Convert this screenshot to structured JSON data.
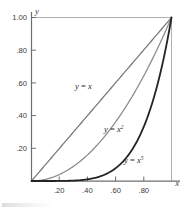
{
  "figure": {
    "background_color": "#ffffff",
    "axis_color": "#6e6e6e",
    "frame_color": "#aeaeae",
    "text_color": "#3a3a3a"
  },
  "chart_data": {
    "type": "line",
    "title": "",
    "subtitle": "",
    "xlabel": "x",
    "ylabel": "y",
    "xlim": [
      0,
      1
    ],
    "ylim": [
      0,
      1
    ],
    "grid": false,
    "legend_position": "inline-annotations",
    "x_tick_labels": [
      ".20",
      ".40",
      ".60",
      ".80"
    ],
    "x_tick_values": [
      0.2,
      0.4,
      0.6,
      0.8
    ],
    "y_tick_labels": [
      ".20",
      ".40",
      ".60",
      ".80",
      "1.00"
    ],
    "y_tick_values": [
      0.2,
      0.4,
      0.6,
      0.8,
      1.0
    ],
    "x": [
      0,
      0.1,
      0.2,
      0.3,
      0.4,
      0.5,
      0.6,
      0.7,
      0.8,
      0.9,
      1.0
    ],
    "series": [
      {
        "name": "y = x",
        "exponent": 1,
        "color": "#777777",
        "line_width": 1.25,
        "values": [
          0,
          0.1,
          0.2,
          0.3,
          0.4,
          0.5,
          0.6,
          0.7,
          0.8,
          0.9,
          1.0
        ],
        "label_text": "y = x",
        "label_base": "y",
        "label_op": " = ",
        "label_var": "x",
        "label_sup": ""
      },
      {
        "name": "y = x^2",
        "exponent": 2,
        "color": "#8a8a8a",
        "line_width": 1.25,
        "values": [
          0,
          0.01,
          0.04,
          0.09,
          0.16,
          0.25,
          0.36,
          0.49,
          0.64,
          0.81,
          1.0
        ],
        "label_text": "y = x2",
        "label_base": "y",
        "label_op": " = ",
        "label_var": "x",
        "label_sup": "2"
      },
      {
        "name": "y = x^5",
        "exponent": 5,
        "color": "#242424",
        "line_width": 1.8,
        "values": [
          0,
          1e-05,
          0.00032,
          0.00243,
          0.01024,
          0.03125,
          0.07776,
          0.16807,
          0.32768,
          0.59049,
          1.0
        ],
        "label_text": "y = x5",
        "label_base": "y",
        "label_op": " = ",
        "label_var": "x",
        "label_sup": "5"
      }
    ],
    "annotations": [
      {
        "text": "y = x",
        "x": 0.33,
        "y": 0.62
      },
      {
        "text": "y = x2",
        "x": 0.55,
        "y": 0.37
      },
      {
        "text": "y = x5",
        "x": 0.76,
        "y": 0.155
      }
    ]
  }
}
